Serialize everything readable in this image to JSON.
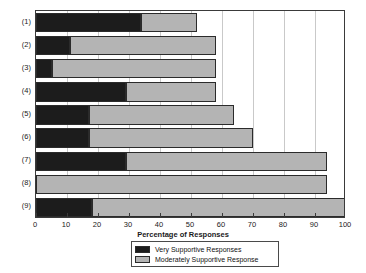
{
  "chart_data": {
    "type": "bar",
    "orientation": "horizontal",
    "stacked": true,
    "title": "",
    "xlabel": "Percentage of Responses",
    "ylabel": "",
    "xlim": [
      0,
      100
    ],
    "xticks": [
      0,
      10,
      20,
      30,
      40,
      50,
      60,
      70,
      80,
      90,
      100
    ],
    "xtick_labels": [
      "0",
      "10",
      "20",
      "30",
      "40",
      "50",
      "60",
      "70",
      "80",
      "90",
      "100"
    ],
    "categories": [
      "(1)",
      "(2)",
      "(3)",
      "(4)",
      "(5)",
      "(6)",
      "(7)",
      "(8)",
      "(9)"
    ],
    "grid": true,
    "grid_axis": "x",
    "legend_position": "bottom-center",
    "series": [
      {
        "name": "Very Supportive Responses",
        "color": "#1c1c1c",
        "values": [
          34,
          11,
          5,
          29,
          17,
          17,
          29,
          0,
          18
        ]
      },
      {
        "name": "Moderately Supportive Response",
        "color": "#b4b4b4",
        "values": [
          18,
          47,
          53,
          29,
          47,
          53,
          65,
          94,
          82
        ]
      }
    ],
    "cumulative_totals": [
      52,
      58,
      58,
      58,
      64,
      70,
      94,
      94,
      100
    ]
  },
  "legend": {
    "items": [
      {
        "label": "Very Supportive Responses",
        "swatch": "very"
      },
      {
        "label": "Moderately Supportive Response",
        "swatch": "moderate"
      }
    ]
  },
  "axis": {
    "x_title": "Percentage of Responses"
  },
  "colors": {
    "very_supportive": "#1c1c1c",
    "moderately_supportive": "#b4b4b4",
    "frame": "#3a3a3a",
    "grid": "#c9c9c9",
    "background": "#ffffff"
  }
}
